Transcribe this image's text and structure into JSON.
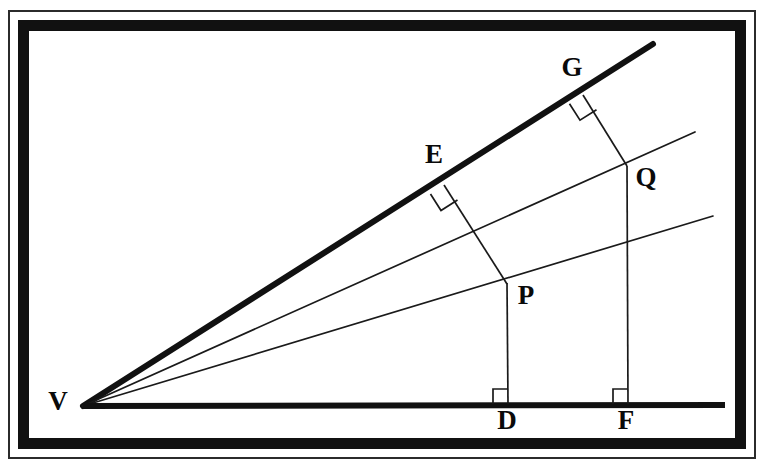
{
  "figure": {
    "background_color": "#ffffff",
    "ink_color": "#111111",
    "frame": {
      "style": "double-rule",
      "outer_color": "#2b2b2b",
      "inner_color": "#111111"
    },
    "labels": {
      "V": "V",
      "E": "E",
      "G": "G",
      "P": "P",
      "Q": "Q",
      "D": "D",
      "F": "F"
    },
    "label_positions": {
      "V": {
        "x": 58,
        "y": 404
      },
      "E": {
        "x": 434,
        "y": 157
      },
      "G": {
        "x": 572,
        "y": 70
      },
      "P": {
        "x": 526,
        "y": 298
      },
      "Q": {
        "x": 646,
        "y": 180
      },
      "D": {
        "x": 507,
        "y": 423
      },
      "F": {
        "x": 626,
        "y": 423
      }
    },
    "points": {
      "V": {
        "x": 83,
        "y": 407
      },
      "E": {
        "x": 444,
        "y": 185
      },
      "G": {
        "x": 583,
        "y": 95
      },
      "P": {
        "x": 507,
        "y": 283
      },
      "Q": {
        "x": 627,
        "y": 166
      },
      "D": {
        "x": 508,
        "y": 405
      },
      "F": {
        "x": 628,
        "y": 405
      }
    },
    "rays": [
      {
        "name": "upper-ray-thick",
        "from": "V",
        "through": "E, G",
        "weight": "thick",
        "end": {
          "x": 653,
          "y": 44
        }
      },
      {
        "name": "middle-ray",
        "from": "V",
        "through": "Q",
        "weight": "thin",
        "end": {
          "x": 695,
          "y": 132
        }
      },
      {
        "name": "lower-ray",
        "from": "V",
        "through": "P",
        "weight": "thin",
        "end": {
          "x": 713,
          "y": 216
        }
      },
      {
        "name": "base-ray",
        "from": "V",
        "through": "D, F",
        "weight": "thick",
        "end": {
          "x": 725,
          "y": 405
        }
      }
    ],
    "segments": [
      {
        "name": "segment-EP",
        "from": "E",
        "to": "P",
        "perpendicular_to": "upper-ray-thick"
      },
      {
        "name": "segment-GQ",
        "from": "G",
        "to": "Q",
        "perpendicular_to": "upper-ray-thick"
      },
      {
        "name": "segment-PD",
        "from": "P",
        "to": "D",
        "perpendicular_to": "base-ray"
      },
      {
        "name": "segment-QF",
        "from": "Q",
        "to": "F",
        "perpendicular_to": "base-ray"
      }
    ],
    "right_angle_marks": [
      {
        "name": "right-angle-at-E",
        "at": "E",
        "size": 17
      },
      {
        "name": "right-angle-at-G",
        "at": "G",
        "size": 17
      },
      {
        "name": "right-angle-at-D",
        "at": "D",
        "size": 15
      },
      {
        "name": "right-angle-at-F",
        "at": "F",
        "size": 15
      }
    ]
  }
}
